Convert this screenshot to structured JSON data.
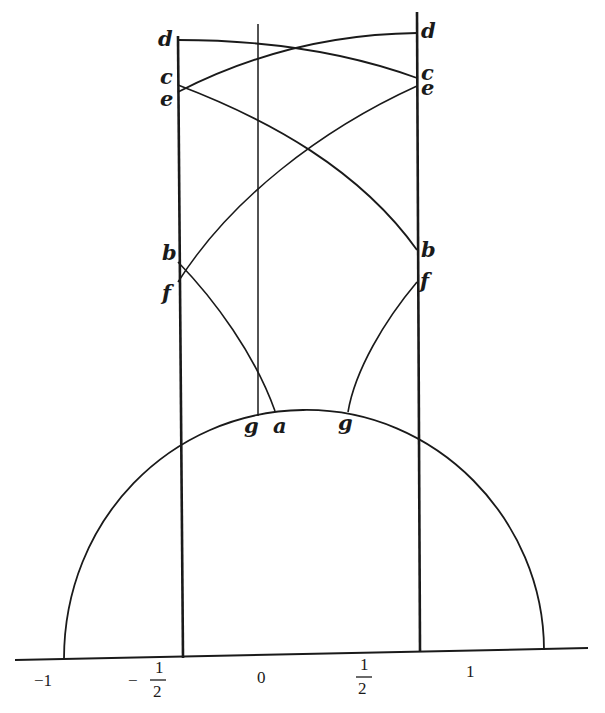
{
  "figure": {
    "axis": {
      "ticks": [
        {
          "label": "−1",
          "x": 64
        },
        {
          "label": "−",
          "frac_num": "1",
          "frac_den": "2",
          "x": 183
        },
        {
          "label": "0",
          "x": 303
        },
        {
          "label": "",
          "frac_num": "1",
          "frac_den": "2",
          "x": 420
        },
        {
          "label": "1",
          "x": 544
        }
      ]
    },
    "points": {
      "d_left": "d",
      "d_right": "d",
      "c_left": "c",
      "c_right": "c",
      "e_left": "e",
      "e_right": "e",
      "b_left": "b",
      "b_right": "b",
      "f_left": "f",
      "f_right": "f",
      "g_left": "g",
      "a": "a",
      "g_right": "g"
    }
  },
  "colors": {
    "ink": "#1a1a1a",
    "paper": "#ffffff"
  }
}
